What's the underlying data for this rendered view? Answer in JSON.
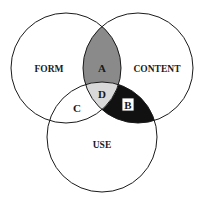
{
  "diagram": {
    "type": "venn",
    "circles": [
      {
        "id": "form",
        "label": "FORM",
        "cx": 66,
        "cy": 68,
        "r": 55
      },
      {
        "id": "content",
        "label": "CONTENT",
        "cx": 138,
        "cy": 68,
        "r": 55
      },
      {
        "id": "use",
        "label": "USE",
        "cx": 102,
        "cy": 137,
        "r": 55
      }
    ],
    "regions": [
      {
        "id": "A",
        "label": "A",
        "between": [
          "form",
          "content"
        ],
        "fill": "#8a8a8a"
      },
      {
        "id": "B",
        "label": "B",
        "between": [
          "content",
          "use"
        ],
        "fill": "#111111",
        "boxed": true
      },
      {
        "id": "C",
        "label": "C",
        "between": [
          "form",
          "use"
        ],
        "fill": "#ffffff"
      },
      {
        "id": "D",
        "label": "D",
        "between": [
          "form",
          "content",
          "use"
        ],
        "fill": "#d9d9d9"
      }
    ],
    "colors": {
      "stroke": "#1a1a1a",
      "background": "#ffffff"
    }
  }
}
